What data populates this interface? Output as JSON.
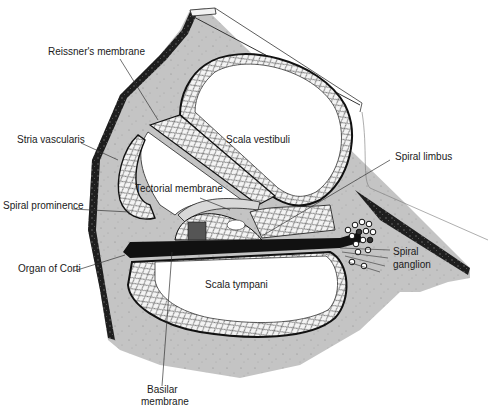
{
  "diagram": {
    "colors": {
      "bone": "#c4c4c4",
      "bone_dark": "#1e1e1e",
      "cavity": "#ffffff",
      "ink": "#1a1a1a",
      "tissue": "#e8e8e8"
    },
    "labels": {
      "reissners_membrane": "Reissner's membrane",
      "scala_vestibuli": "Scala vestibuli",
      "stria_vascularis": "Stria vascularis",
      "spiral_limbus": "Spiral limbus",
      "tectorial_membrane": "Tectorial membrane",
      "spiral_prominence": "Spiral prominence",
      "organ_of_corti": "Organ of Corti",
      "spiral_ganglion_1": "Spiral",
      "spiral_ganglion_2": "ganglion",
      "scala_tympani": "Scala tympani",
      "basilar_membrane_1": "Basilar",
      "basilar_membrane_2": "membrane"
    }
  }
}
